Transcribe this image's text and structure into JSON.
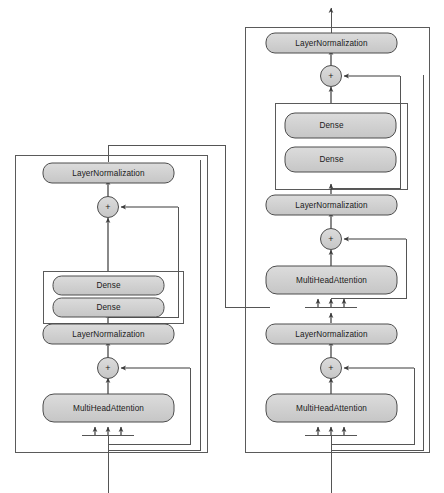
{
  "figure": {
    "type": "diagram",
    "title": "",
    "background_color": "#ffffff",
    "node_fill": "#d0d0d0",
    "node_stroke": "#4d4d4d",
    "line_color": "#555555",
    "text_color": "#1a1a1a"
  },
  "blocks": [
    {
      "id": "left-block",
      "name": "encoder-block",
      "nodes": [
        {
          "id": "ln-top",
          "label": "LayerNormalization",
          "kind": "layer"
        },
        {
          "id": "add-top",
          "label": "+",
          "kind": "add"
        },
        {
          "id": "dense-upper",
          "label": "Dense",
          "kind": "layer"
        },
        {
          "id": "dense-lower",
          "label": "Dense",
          "kind": "layer"
        },
        {
          "id": "ln-mid",
          "label": "LayerNormalization",
          "kind": "layer"
        },
        {
          "id": "add-bottom",
          "label": "+",
          "kind": "add"
        },
        {
          "id": "mha",
          "label": "MultiHeadAttention",
          "kind": "layer"
        }
      ]
    },
    {
      "id": "right-block",
      "name": "decoder-block",
      "nodes": [
        {
          "id": "ln-top",
          "label": "LayerNormalization",
          "kind": "layer"
        },
        {
          "id": "add-top",
          "label": "+",
          "kind": "add"
        },
        {
          "id": "dense-upper",
          "label": "Dense",
          "kind": "layer"
        },
        {
          "id": "dense-lower",
          "label": "Dense",
          "kind": "layer"
        },
        {
          "id": "ln-mid",
          "label": "LayerNormalization",
          "kind": "layer"
        },
        {
          "id": "add-mid",
          "label": "+",
          "kind": "add"
        },
        {
          "id": "mha-cross",
          "label": "MultiHeadAttention",
          "kind": "layer"
        },
        {
          "id": "ln-bottom",
          "label": "LayerNormalization",
          "kind": "layer"
        },
        {
          "id": "add-bottom",
          "label": "+",
          "kind": "add"
        },
        {
          "id": "mha-self",
          "label": "MultiHeadAttention",
          "kind": "layer"
        }
      ]
    }
  ],
  "labels": {
    "layer_normalization": "LayerNormalization",
    "dense": "Dense",
    "multi_head_attention": "MultiHeadAttention",
    "add": "+"
  }
}
